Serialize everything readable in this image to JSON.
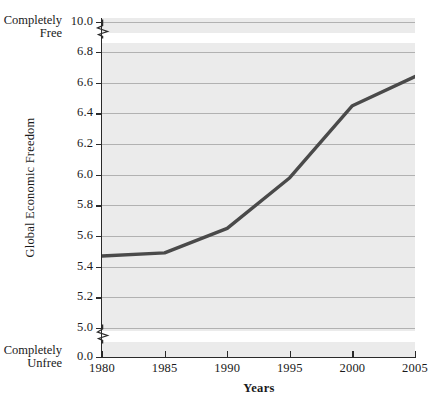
{
  "chart_data": {
    "type": "line",
    "title": "",
    "xlabel": "Years",
    "ylabel": "Global Economic Freedom",
    "x": [
      1980,
      1985,
      1990,
      1995,
      2000,
      2005
    ],
    "values": [
      5.47,
      5.49,
      5.65,
      5.98,
      6.45,
      6.64
    ],
    "series": [
      {
        "name": "Global Economic Freedom",
        "values": [
          5.47,
          5.49,
          5.65,
          5.98,
          6.45,
          6.64
        ]
      }
    ],
    "xlim": [
      1980,
      2005
    ],
    "ylim": [
      5.0,
      6.8
    ],
    "y_axis_broken": true,
    "y_break_segments": [
      {
        "from": 0.0,
        "to": 5.0,
        "note": "axis break below 5.0"
      },
      {
        "from": 6.8,
        "to": 10.0,
        "note": "axis break above 6.8"
      }
    ],
    "grid": true,
    "legend": "none",
    "x_tick_labels": [
      "1980",
      "1985",
      "1990",
      "1995",
      "2000",
      "2005"
    ],
    "y_tick_labels": [
      "10.0",
      "6.8",
      "6.6",
      "6.4",
      "6.2",
      "6.0",
      "5.8",
      "5.6",
      "5.4",
      "5.2",
      "5.0",
      "0.0"
    ],
    "y_ticks": [
      10.0,
      6.8,
      6.6,
      6.4,
      6.2,
      6.0,
      5.8,
      5.6,
      5.4,
      5.2,
      5.0,
      0.0
    ],
    "annotations": [
      {
        "id": "free",
        "text": "Completely\nFree",
        "line1": "Completely",
        "line2": "Free",
        "at_tick": "10.0"
      },
      {
        "id": "unfree",
        "text": "Completely\nUnfree",
        "line1": "Completely",
        "line2": "Unfree",
        "at_tick": "0.0"
      }
    ],
    "colors": {
      "plot_background": "#ebebeb",
      "gridline": "#9d9d9d",
      "axis": "#2a2a2a",
      "series_line": "#4a4a4a",
      "page_background": "#ffffff",
      "text": "#1a1a1a"
    }
  },
  "axes": {
    "y_title": "Global Economic Freedom",
    "x_title": "Years",
    "y_tick_labels": [
      "10.0",
      "6.8",
      "6.6",
      "6.4",
      "6.2",
      "6.0",
      "5.8",
      "5.6",
      "5.4",
      "5.2",
      "5.0",
      "0.0"
    ],
    "x_tick_labels": [
      "1980",
      "1985",
      "1990",
      "1995",
      "2000",
      "2005"
    ]
  },
  "notes": {
    "free_line1": "Completely",
    "free_line2": "Free",
    "unfree_line1": "Completely",
    "unfree_line2": "Unfree"
  }
}
